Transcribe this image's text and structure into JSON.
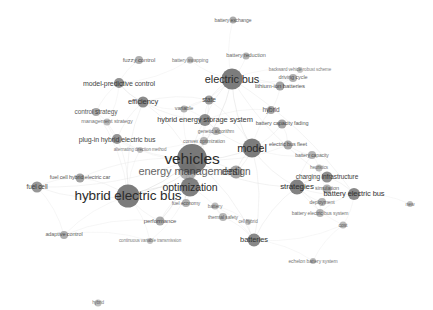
{
  "view": {
    "title": "bibliometric co-occurrence network map",
    "width": 433,
    "height": 310,
    "background_color": "#ffffff",
    "node_color": "#6e6e6e",
    "edge_color": "#cfcfcf",
    "label_color": "#2b2b2b",
    "type": "network-map"
  },
  "nodes": [
    {
      "label": "vehicles",
      "x": 192,
      "y": 159,
      "r": 15.0,
      "fs": 15.5,
      "o": 0.92
    },
    {
      "label": "hybrid electric bus",
      "x": 128,
      "y": 196,
      "r": 11.5,
      "fs": 13.5,
      "o": 0.9
    },
    {
      "label": "energy management",
      "x": 188,
      "y": 171,
      "r": 9.0,
      "fs": 11.0,
      "o": 0.55
    },
    {
      "label": "optimization",
      "x": 190,
      "y": 187,
      "r": 9.5,
      "fs": 10.5,
      "o": 0.88
    },
    {
      "label": "electric bus",
      "x": 232,
      "y": 79,
      "r": 10.5,
      "fs": 11.0,
      "o": 0.9
    },
    {
      "label": "model",
      "x": 252,
      "y": 148,
      "r": 9.5,
      "fs": 11.0,
      "o": 0.9
    },
    {
      "label": "design",
      "x": 236,
      "y": 172,
      "r": 6.5,
      "fs": 10.0,
      "o": 0.62
    },
    {
      "label": "strategies",
      "x": 297,
      "y": 187,
      "r": 7.5,
      "fs": 8.0,
      "o": 0.86
    },
    {
      "label": "batteries",
      "x": 254,
      "y": 240,
      "r": 6.5,
      "fs": 7.5,
      "o": 0.82
    },
    {
      "label": "battery electric bus",
      "x": 354,
      "y": 194,
      "r": 6.0,
      "fs": 7.5,
      "o": 0.82
    },
    {
      "label": "charging infrastructure",
      "x": 327,
      "y": 177,
      "r": 5.5,
      "fs": 6.5,
      "o": 0.78
    },
    {
      "label": "hybrid energy storage system",
      "x": 205,
      "y": 120,
      "r": 6.0,
      "fs": 7.5,
      "o": 0.8
    },
    {
      "label": "model-predictive control",
      "x": 119,
      "y": 83,
      "r": 5.0,
      "fs": 7.0,
      "o": 0.76
    },
    {
      "label": "plug-in hybrid electric bus",
      "x": 117,
      "y": 139,
      "r": 5.0,
      "fs": 7.0,
      "o": 0.74
    },
    {
      "label": "efficiency",
      "x": 143,
      "y": 102,
      "r": 5.5,
      "fs": 7.5,
      "o": 0.8
    },
    {
      "label": "control strategy",
      "x": 96,
      "y": 112,
      "r": 4.0,
      "fs": 6.5,
      "o": 0.62
    },
    {
      "label": "management strategy",
      "x": 107,
      "y": 122,
      "r": 3.5,
      "fs": 5.5,
      "o": 0.46
    },
    {
      "label": "fuzzy control",
      "x": 139,
      "y": 60,
      "r": 4.0,
      "fs": 6.0,
      "o": 0.56
    },
    {
      "label": "battery swapping",
      "x": 190,
      "y": 60,
      "r": 3.5,
      "fs": 5.0,
      "o": 0.46
    },
    {
      "label": "battery reduction",
      "x": 246,
      "y": 56,
      "r": 3.5,
      "fs": 5.5,
      "o": 0.52
    },
    {
      "label": "battery exchange",
      "x": 233,
      "y": 20,
      "r": 3.5,
      "fs": 5.0,
      "o": 0.58
    },
    {
      "label": "state",
      "x": 209,
      "y": 100,
      "r": 4.5,
      "fs": 6.5,
      "o": 0.68
    },
    {
      "label": "variable",
      "x": 184,
      "y": 109,
      "r": 3.5,
      "fs": 5.5,
      "o": 0.52
    },
    {
      "label": "hybrid",
      "x": 271,
      "y": 110,
      "r": 4.0,
      "fs": 6.5,
      "o": 0.62
    },
    {
      "label": "lithium-ion batteries",
      "x": 280,
      "y": 86,
      "r": 4.5,
      "fs": 6.0,
      "o": 0.64
    },
    {
      "label": "driving cycle",
      "x": 293,
      "y": 78,
      "r": 4.0,
      "fs": 5.5,
      "o": 0.55
    },
    {
      "label": "backward vehicle robust scheme",
      "x": 300,
      "y": 70,
      "r": 3.0,
      "fs": 4.5,
      "o": 0.4
    },
    {
      "label": "battery capacity fading",
      "x": 282,
      "y": 124,
      "r": 4.5,
      "fs": 5.5,
      "o": 0.62
    },
    {
      "label": "electric bus fleet",
      "x": 288,
      "y": 145,
      "r": 4.5,
      "fs": 5.5,
      "o": 0.6
    },
    {
      "label": "battery capacity",
      "x": 312,
      "y": 155,
      "r": 4.0,
      "fs": 5.0,
      "o": 0.52
    },
    {
      "label": "heuristics",
      "x": 319,
      "y": 168,
      "r": 3.5,
      "fs": 4.5,
      "o": 0.46
    },
    {
      "label": "simulation",
      "x": 327,
      "y": 189,
      "r": 4.5,
      "fs": 5.5,
      "o": 0.56
    },
    {
      "label": "deployment",
      "x": 322,
      "y": 202,
      "r": 4.0,
      "fs": 5.0,
      "o": 0.52
    },
    {
      "label": "battery electric bus system",
      "x": 320,
      "y": 213,
      "r": 4.0,
      "fs": 5.0,
      "o": 0.5
    },
    {
      "label": "cost",
      "x": 343,
      "y": 225,
      "r": 3.5,
      "fs": 5.0,
      "o": 0.48
    },
    {
      "label": "new",
      "x": 410,
      "y": 204,
      "r": 3.0,
      "fs": 5.0,
      "o": 0.44
    },
    {
      "label": "echelon battery system",
      "x": 313,
      "y": 261,
      "r": 3.0,
      "fs": 5.0,
      "o": 0.46
    },
    {
      "label": "genetic algorithm",
      "x": 216,
      "y": 131,
      "r": 4.0,
      "fs": 5.0,
      "o": 0.5
    },
    {
      "label": "convex optimization",
      "x": 204,
      "y": 141,
      "r": 4.0,
      "fs": 5.0,
      "o": 0.5
    },
    {
      "label": "alternating direction method",
      "x": 140,
      "y": 150,
      "r": 3.0,
      "fs": 4.5,
      "o": 0.42
    },
    {
      "label": "fuel cell hybrid electric car",
      "x": 80,
      "y": 178,
      "r": 4.5,
      "fs": 5.5,
      "o": 0.64
    },
    {
      "label": "fuel cell",
      "x": 37,
      "y": 187,
      "r": 5.5,
      "fs": 6.5,
      "o": 0.72
    },
    {
      "label": "fuel economy",
      "x": 186,
      "y": 203,
      "r": 4.0,
      "fs": 5.0,
      "o": 0.52
    },
    {
      "label": "performance",
      "x": 160,
      "y": 221,
      "r": 4.5,
      "fs": 6.0,
      "o": 0.6
    },
    {
      "label": "adaptive control",
      "x": 64,
      "y": 235,
      "r": 4.0,
      "fs": 5.5,
      "o": 0.56
    },
    {
      "label": "continuous variable transmission",
      "x": 150,
      "y": 241,
      "r": 3.0,
      "fs": 4.5,
      "o": 0.42
    },
    {
      "label": "thermal safety",
      "x": 223,
      "y": 217,
      "r": 4.0,
      "fs": 5.0,
      "o": 0.5
    },
    {
      "label": "cell hybrid",
      "x": 248,
      "y": 222,
      "r": 3.0,
      "fs": 4.5,
      "o": 0.42
    },
    {
      "label": "battery",
      "x": 215,
      "y": 206,
      "r": 3.5,
      "fs": 5.0,
      "o": 0.46
    },
    {
      "label": "hybrid",
      "x": 98,
      "y": 303,
      "r": 3.5,
      "fs": 4.5,
      "o": 0.44
    }
  ],
  "edges": [
    [
      0,
      1
    ],
    [
      0,
      2
    ],
    [
      0,
      3
    ],
    [
      0,
      5
    ],
    [
      0,
      6
    ],
    [
      0,
      4
    ],
    [
      0,
      11
    ],
    [
      0,
      14
    ],
    [
      0,
      13
    ],
    [
      0,
      21
    ],
    [
      0,
      37
    ],
    [
      0,
      38
    ],
    [
      0,
      39
    ],
    [
      0,
      42
    ],
    [
      0,
      43
    ],
    [
      0,
      7
    ],
    [
      0,
      8
    ],
    [
      0,
      28
    ],
    [
      0,
      22
    ],
    [
      1,
      2
    ],
    [
      1,
      3
    ],
    [
      1,
      13
    ],
    [
      1,
      14
    ],
    [
      1,
      15
    ],
    [
      1,
      39
    ],
    [
      1,
      40
    ],
    [
      1,
      41
    ],
    [
      1,
      43
    ],
    [
      1,
      45
    ],
    [
      1,
      44
    ],
    [
      4,
      18
    ],
    [
      4,
      19
    ],
    [
      4,
      20
    ],
    [
      4,
      21
    ],
    [
      4,
      22
    ],
    [
      4,
      11
    ],
    [
      4,
      24
    ],
    [
      4,
      25
    ],
    [
      4,
      26
    ],
    [
      4,
      5
    ],
    [
      4,
      9
    ],
    [
      4,
      10
    ],
    [
      5,
      6
    ],
    [
      5,
      7
    ],
    [
      5,
      23
    ],
    [
      5,
      27
    ],
    [
      5,
      28
    ],
    [
      5,
      29
    ],
    [
      5,
      8
    ],
    [
      5,
      21
    ],
    [
      5,
      11
    ],
    [
      7,
      9
    ],
    [
      7,
      10
    ],
    [
      7,
      30
    ],
    [
      7,
      31
    ],
    [
      7,
      32
    ],
    [
      7,
      33
    ],
    [
      7,
      34
    ],
    [
      7,
      29
    ],
    [
      8,
      46
    ],
    [
      8,
      47
    ],
    [
      8,
      48
    ],
    [
      8,
      36
    ],
    [
      8,
      34
    ],
    [
      9,
      35
    ],
    [
      9,
      33
    ],
    [
      9,
      34
    ],
    [
      9,
      10
    ],
    [
      11,
      21
    ],
    [
      11,
      22
    ],
    [
      11,
      37
    ],
    [
      11,
      38
    ],
    [
      11,
      23
    ],
    [
      12,
      14
    ],
    [
      12,
      17
    ],
    [
      12,
      15
    ],
    [
      12,
      16
    ],
    [
      12,
      18
    ],
    [
      13,
      14
    ],
    [
      13,
      15
    ],
    [
      13,
      16
    ],
    [
      13,
      39
    ],
    [
      14,
      21
    ],
    [
      14,
      22
    ],
    [
      14,
      12
    ],
    [
      14,
      11
    ],
    [
      2,
      3
    ],
    [
      2,
      42
    ],
    [
      2,
      43
    ],
    [
      2,
      6
    ],
    [
      3,
      42
    ],
    [
      3,
      43
    ],
    [
      3,
      46
    ],
    [
      3,
      38
    ],
    [
      3,
      45
    ],
    [
      40,
      41
    ],
    [
      41,
      44
    ],
    [
      43,
      44
    ],
    [
      44,
      45
    ],
    [
      23,
      24
    ],
    [
      24,
      25
    ],
    [
      25,
      26
    ],
    [
      27,
      28
    ],
    [
      28,
      29
    ],
    [
      29,
      30
    ],
    [
      30,
      31
    ],
    [
      31,
      32
    ],
    [
      32,
      33
    ],
    [
      46,
      48
    ],
    [
      47,
      48
    ],
    [
      8,
      7
    ],
    [
      34,
      36
    ],
    [
      6,
      5
    ],
    [
      21,
      22
    ],
    [
      37,
      39
    ],
    [
      0,
      40
    ],
    [
      0,
      41
    ]
  ],
  "footer": {
    "note": ""
  }
}
